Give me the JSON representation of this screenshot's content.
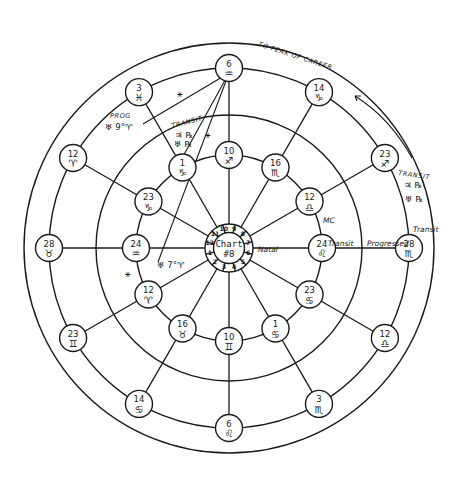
{
  "chart_data": {
    "type": "diagram",
    "title": "Chart #8",
    "center": {
      "title_line1": "Chart",
      "title_line2": "#8"
    },
    "houses": [
      "1",
      "2",
      "3",
      "4",
      "5",
      "6",
      "7",
      "8",
      "9",
      "10",
      "11",
      "12"
    ],
    "inner_ring_label": "Natal",
    "inner_ring": [
      {
        "position": "top",
        "degree": "10",
        "sign": "♐"
      },
      {
        "position": "30",
        "degree": "16",
        "sign": "♏"
      },
      {
        "position": "60",
        "degree": "12",
        "sign": "♎"
      },
      {
        "position": "right",
        "degree": "24",
        "sign": "♌"
      },
      {
        "position": "120",
        "degree": "23",
        "sign": "♋"
      },
      {
        "position": "150",
        "degree": "1",
        "sign": "♋"
      },
      {
        "position": "bottom",
        "degree": "10",
        "sign": "♊"
      },
      {
        "position": "210",
        "degree": "16",
        "sign": "♉"
      },
      {
        "position": "240",
        "degree": "12",
        "sign": "♈"
      },
      {
        "position": "left",
        "degree": "24",
        "sign": "♒"
      },
      {
        "position": "300",
        "degree": "23",
        "sign": "♑"
      },
      {
        "position": "330",
        "degree": "1",
        "sign": "♑"
      }
    ],
    "outer_ring": [
      {
        "position": "top",
        "degree": "6",
        "sign": "♒"
      },
      {
        "position": "30",
        "degree": "14",
        "sign": "♑"
      },
      {
        "position": "60",
        "degree": "23",
        "sign": "♐"
      },
      {
        "position": "right",
        "degree": "28",
        "sign": "♏"
      },
      {
        "position": "120",
        "degree": "12",
        "sign": "♎"
      },
      {
        "position": "150",
        "degree": "3",
        "sign": "♏"
      },
      {
        "position": "bottom",
        "degree": "6",
        "sign": "♌"
      },
      {
        "position": "210",
        "degree": "14",
        "sign": "♋"
      },
      {
        "position": "240",
        "degree": "23",
        "sign": "♊"
      },
      {
        "position": "left",
        "degree": "28",
        "sign": "♉"
      },
      {
        "position": "300",
        "degree": "12",
        "sign": "♈"
      },
      {
        "position": "330",
        "degree": "3",
        "sign": "♓"
      }
    ],
    "annotations": {
      "natal": "Natal",
      "transit_inner": "Transit",
      "progressed": "Progressed",
      "transit_outer": "Transit",
      "career": "TO PEAK OF CAREER",
      "transit_top_right": "TRANSIT",
      "transit_top_right_planets1": "♃ ℞",
      "transit_top_right_planets2": "♅ ℞",
      "transit_top_left": "TRANSIT",
      "transit_top_left_planets1": "♃ ℞",
      "transit_top_left_planets2": "♅ ℞",
      "prog_label": "PROG",
      "prog_planet": "♅ 9°♈",
      "uranus_natal": "♅ 7°♈",
      "sextile_1": "⚹",
      "sextile_2": "⚹",
      "sextile_3": "⚹",
      "mc_label": "MC",
      "sextile_left": "⚹"
    }
  }
}
